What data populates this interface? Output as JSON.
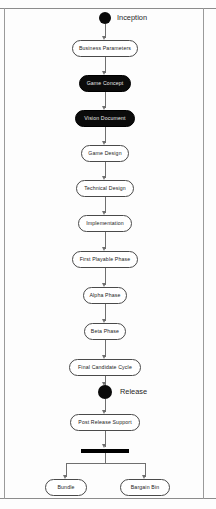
{
  "diagram": {
    "centerline_x": 105,
    "accent_color": "#0a0a0a",
    "line_color": "#6f6f6f",
    "box_border_color": "#4a4a4a",
    "dark_fill_color": "#0b0b0b"
  },
  "start_node": {
    "label": "Inception",
    "type": "initial-node"
  },
  "end_marker": {
    "label": "Release",
    "type": "milestone-node"
  },
  "activities": [
    {
      "id": "business-parameters",
      "label": "Business Parameters",
      "style": "light"
    },
    {
      "id": "game-concept",
      "label": "Game Concept",
      "style": "dark"
    },
    {
      "id": "vision-document",
      "label": "Vision Document",
      "style": "dark"
    },
    {
      "id": "game-design",
      "label": "Game Design",
      "style": "light"
    },
    {
      "id": "technical-design",
      "label": "Technical Design",
      "style": "light"
    },
    {
      "id": "implementation",
      "label": "Implementation",
      "style": "light"
    },
    {
      "id": "first-playable-phase",
      "label": "First Playable Phase",
      "style": "light"
    },
    {
      "id": "alpha-phase",
      "label": "Alpha Phase",
      "style": "light"
    },
    {
      "id": "beta-phase",
      "label": "Beta Phase",
      "style": "light"
    },
    {
      "id": "final-candidate-cycle",
      "label": "Final Candidate Cycle",
      "style": "light"
    },
    {
      "id": "post-release-support",
      "label": "Post Release Support",
      "style": "light"
    }
  ],
  "fork_branches": [
    {
      "id": "bundle",
      "label": "Bundle"
    },
    {
      "id": "bargain-bin",
      "label": "Bargain Bin"
    }
  ]
}
